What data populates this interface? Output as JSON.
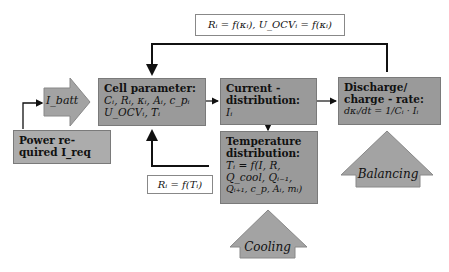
{
  "diagram": {
    "top_formula": "Rᵢ = f(κᵢ), U_OCVᵢ = f(κᵢ)",
    "cell_parameter": {
      "title": "Cell parameter:",
      "line1": "Cᵢ, Rᵢ, κᵢ, Aᵢ, c_pᵢ",
      "line2": "U_OCVᵢ, Tᵢ"
    },
    "current_distribution": {
      "title1": "Current -",
      "title2": "distribution:",
      "line1": "Iᵢ"
    },
    "discharge": {
      "title1": "Discharge/",
      "title2": "charge - rate:",
      "line1": "dκᵢ/dt = 1/Cᵢ · Iᵢ"
    },
    "temperature": {
      "title1": "Temperature",
      "title2": "distribution:",
      "line1": "Tᵢ = f(I, R,",
      "line2": "Q_cool, Qᵢ₋₁,",
      "line3": "Qᵢ₊₁, c_p, Aᵢ, mᵢ)"
    },
    "power_required": {
      "line1": "Power re-",
      "line2": "quired I_req"
    },
    "i_batt_label": "I_batt",
    "temp_feedback_formula": "Rᵢ = f(Tᵢ)",
    "balancing_label": "Balancing",
    "cooling_label": "Cooling",
    "colors": {
      "box_fill": "#9a9a9a",
      "arrow_fill": "#a3a3a3",
      "line": "#111111"
    }
  }
}
